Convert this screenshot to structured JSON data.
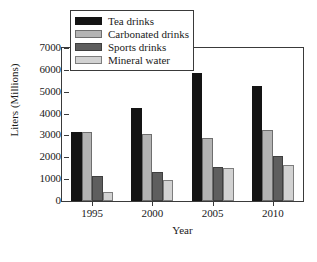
{
  "chart_data": {
    "type": "bar",
    "title": "",
    "xlabel": "Year",
    "ylabel": "Liters (Millions)",
    "categories": [
      "1995",
      "2000",
      "2005",
      "2010"
    ],
    "series": [
      {
        "name": "Tea drinks",
        "color": "#141414",
        "values": [
          3150,
          4250,
          5870,
          5250
        ]
      },
      {
        "name": "Carbonated drinks",
        "color": "#b4b4b4",
        "values": [
          3140,
          3070,
          2880,
          3250
        ]
      },
      {
        "name": "Sports drinks",
        "color": "#5e5e5e",
        "values": [
          1150,
          1310,
          1550,
          2080
        ]
      },
      {
        "name": "Mineral water",
        "color": "#d2d2d2",
        "values": [
          420,
          980,
          1500,
          1650
        ]
      }
    ],
    "ylim": [
      0,
      7000
    ],
    "yticks": [
      0,
      1000,
      2000,
      3000,
      4000,
      5000,
      6000,
      7000
    ],
    "ytick_labels": [
      "0",
      "1000",
      "2000",
      "3000",
      "4000",
      "5000",
      "6000",
      "7000"
    ],
    "grid": false,
    "legend_position": "top-left",
    "legend_entries": [
      "Tea drinks",
      "Carbonated drinks",
      "Sports drinks",
      "Mineral water"
    ]
  }
}
